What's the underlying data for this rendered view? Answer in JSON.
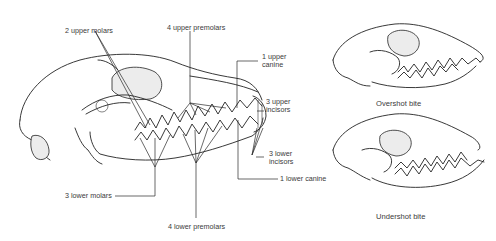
{
  "diagram": {
    "main_skull": {
      "labels": {
        "upper_molars": "2 upper molars",
        "upper_premolars": "4 upper premolars",
        "upper_canine_line1": "1 upper",
        "upper_canine_line2": "canine",
        "upper_incisors_line1": "3 upper",
        "upper_incisors_line2": "incisors",
        "lower_incisors_line1": "3 lower",
        "lower_incisors_line2": "incisors",
        "lower_canine": "1 lower canine",
        "lower_molars": "3 lower molars",
        "lower_premolars": "4 lower premolars"
      }
    },
    "insets": [
      {
        "caption": "Overshot bite"
      },
      {
        "caption": "Undershot bite"
      }
    ],
    "colors": {
      "ink": "#222222",
      "text": "#3a3a3a",
      "background": "#ffffff",
      "stipple": "#ececec"
    }
  }
}
